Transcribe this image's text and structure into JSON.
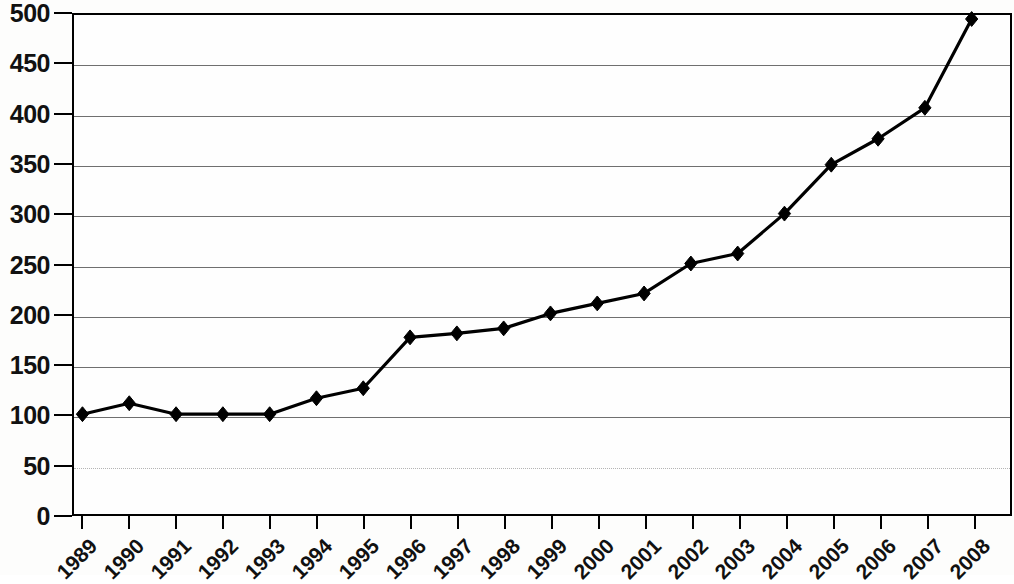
{
  "chart_data": {
    "type": "line",
    "title": "",
    "subtitle": "",
    "xlabel": "",
    "ylabel": "",
    "grid": true,
    "legend": false,
    "legend_position": "none",
    "marker": "diamond",
    "series_color": "#000000",
    "xlim": [
      "1989",
      "2008"
    ],
    "ylim": [
      0,
      500
    ],
    "ytick_step": 50,
    "yticks": [
      500,
      450,
      400,
      350,
      300,
      250,
      200,
      150,
      100,
      50,
      0
    ],
    "ytick_labels": [
      "500",
      "450",
      "400",
      "350",
      "300",
      "250",
      "200",
      "150",
      "100",
      "50",
      "0"
    ],
    "categories": [
      "1989",
      "1990",
      "1991",
      "1992",
      "1993",
      "1994",
      "1995",
      "1996",
      "1997",
      "1998",
      "1999",
      "2000",
      "2001",
      "2002",
      "2003",
      "2004",
      "2005",
      "2006",
      "2007",
      "2008"
    ],
    "values": [
      100,
      111,
      100,
      100,
      100,
      116,
      126,
      177,
      181,
      186,
      201,
      211,
      221,
      251,
      261,
      301,
      350,
      376,
      407,
      496
    ]
  }
}
